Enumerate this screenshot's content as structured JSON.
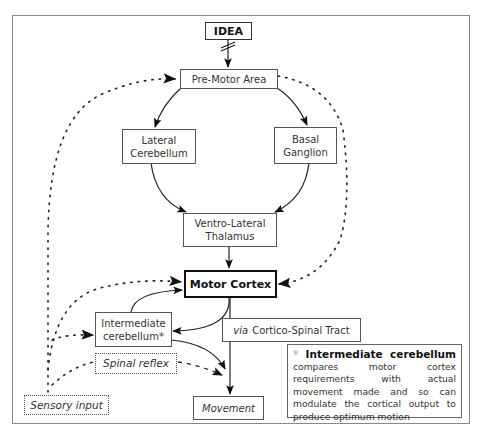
{
  "diagram": {
    "nodes": {
      "idea": "IDEA",
      "pre_motor_area": "Pre-Motor Area",
      "lateral_cerebellum": [
        "Lateral",
        "Cerebellum"
      ],
      "basal_ganglion": [
        "Basal",
        "Ganglion"
      ],
      "ventro_lateral_thalamus": [
        "Ventro-Lateral",
        "Thalamus"
      ],
      "motor_cortex": "Motor Cortex",
      "intermediate_cerebellum": [
        "Intermediate",
        "cerebellum*"
      ],
      "cortico_spinal_tract": {
        "prefix": "via",
        "label": "Cortico-Spinal Tract"
      },
      "spinal_reflex": "Spinal reflex",
      "sensory_input": "Sensory input",
      "movement": "Movement"
    },
    "note": {
      "star": "*",
      "title_word1": "Intermediate",
      "title_word2": "cerebellum",
      "body": "compares motor cortex requirements with actual movement made and so can modulate the cortical output to produce optimum motion"
    },
    "edges": [
      {
        "from": "IDEA",
        "to": "Pre-Motor Area",
        "style": "solid",
        "marker": "interrupted"
      },
      {
        "from": "Pre-Motor Area",
        "to": "Lateral Cerebellum",
        "style": "solid"
      },
      {
        "from": "Pre-Motor Area",
        "to": "Basal Ganglion",
        "style": "solid"
      },
      {
        "from": "Lateral Cerebellum",
        "to": "Ventro-Lateral Thalamus",
        "style": "solid"
      },
      {
        "from": "Basal Ganglion",
        "to": "Ventro-Lateral Thalamus",
        "style": "solid"
      },
      {
        "from": "Ventro-Lateral Thalamus",
        "to": "Motor Cortex",
        "style": "solid"
      },
      {
        "from": "Pre-Motor Area",
        "to": "Motor Cortex",
        "style": "dotted"
      },
      {
        "from": "Sensory input",
        "to": "Pre-Motor Area",
        "style": "dotted"
      },
      {
        "from": "Sensory input",
        "to": "Motor Cortex",
        "style": "dotted"
      },
      {
        "from": "Sensory input",
        "to": "Intermediate cerebellum",
        "style": "dotted"
      },
      {
        "from": "Sensory input",
        "to": "Spinal reflex",
        "style": "dotted"
      },
      {
        "from": "Spinal reflex",
        "to": "Movement",
        "style": "dashed"
      },
      {
        "from": "Intermediate cerebellum",
        "to": "Motor Cortex",
        "style": "solid"
      },
      {
        "from": "Motor Cortex",
        "to": "Intermediate cerebellum",
        "style": "solid"
      },
      {
        "from": "Motor Cortex",
        "to": "Movement",
        "style": "solid",
        "label": "via Cortico-Spinal Tract"
      },
      {
        "from": "Intermediate cerebellum",
        "to": "Movement",
        "style": "solid"
      }
    ],
    "colors": {
      "line": "#222222",
      "box_border": "#555555",
      "background": "#ffffff"
    }
  }
}
